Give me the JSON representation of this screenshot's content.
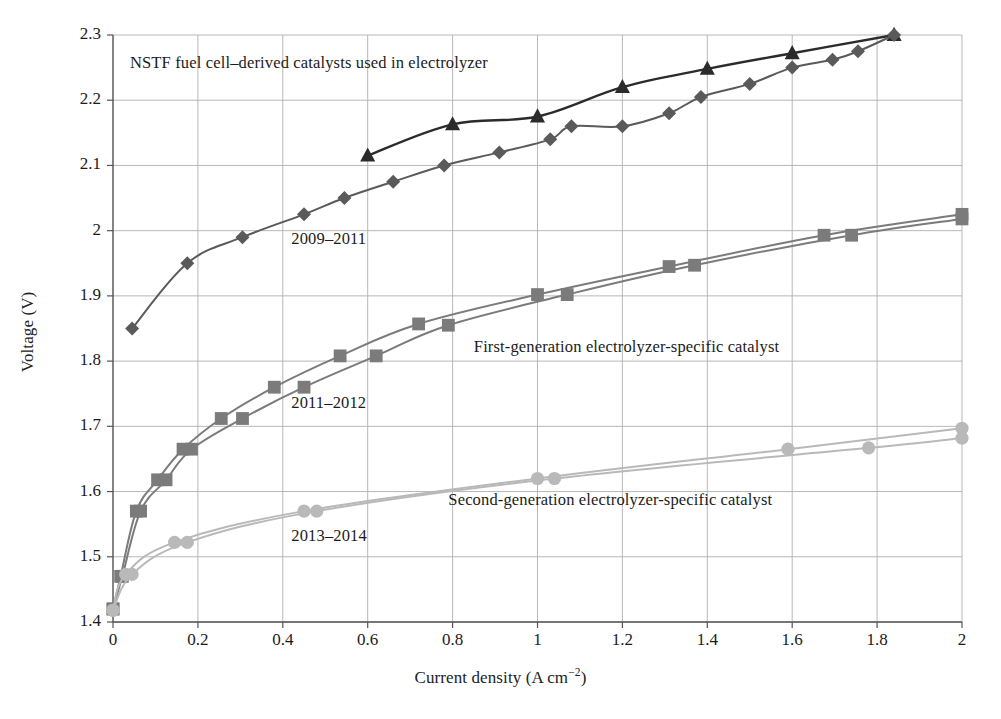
{
  "chart_data": {
    "type": "line",
    "title": "",
    "xlabel": "Current density (A cm⁻²)",
    "ylabel": "Voltage (V)",
    "xlim": [
      0,
      2
    ],
    "ylim": [
      1.4,
      2.3
    ],
    "xticks": [
      "0",
      "0.2",
      "0.4",
      "0.6",
      "0.8",
      "1",
      "1.2",
      "1.4",
      "1.6",
      "1.8",
      "2"
    ],
    "xtick_values": [
      0,
      0.2,
      0.4,
      0.6,
      0.8,
      1,
      1.2,
      1.4,
      1.6,
      1.8,
      2
    ],
    "yticks": [
      "1.4",
      "1.5",
      "1.6",
      "1.7",
      "1.8",
      "1.9",
      "2",
      "2.1",
      "2.2",
      "2.3"
    ],
    "ytick_values": [
      1.4,
      1.5,
      1.6,
      1.7,
      1.8,
      1.9,
      2.0,
      2.1,
      2.2,
      2.3
    ],
    "grid": true,
    "legend": "none",
    "annotations": [
      {
        "text": "NSTF fuel cell–derived catalysts used in electrolyzer",
        "x": 0.04,
        "y": 2.255
      },
      {
        "text": "2009–2011",
        "x": 0.42,
        "y": 1.985
      },
      {
        "text": "First-generation electrolyzer-specific catalyst",
        "x": 0.85,
        "y": 1.82
      },
      {
        "text": "2011–2012",
        "x": 0.42,
        "y": 1.735
      },
      {
        "text": "Second-generation electrolyzer-specific catalyst",
        "x": 0.79,
        "y": 1.585
      },
      {
        "text": "2013–2014",
        "x": 0.42,
        "y": 1.53
      }
    ],
    "series": [
      {
        "name": "2009–2011 triangle",
        "marker": "triangle",
        "color": "#2b2b2b",
        "x": [
          0.6,
          0.8,
          1.0,
          1.2,
          1.4,
          1.6,
          1.84
        ],
        "y": [
          2.115,
          2.163,
          2.175,
          2.22,
          2.248,
          2.272,
          2.3
        ]
      },
      {
        "name": "2009–2011 diamond",
        "marker": "diamond",
        "color": "#5a5a5a",
        "x": [
          0.045,
          0.175,
          0.305,
          0.45,
          0.545,
          0.66,
          0.78,
          0.91,
          1.03,
          1.08,
          1.2,
          1.31,
          1.385,
          1.5,
          1.6,
          1.695,
          1.755,
          1.84
        ],
        "y": [
          1.85,
          1.95,
          1.99,
          2.025,
          2.05,
          2.075,
          2.1,
          2.12,
          2.14,
          2.16,
          2.16,
          2.18,
          2.205,
          2.225,
          2.25,
          2.262,
          2.275,
          2.3
        ]
      },
      {
        "name": "2011–2012 square upper",
        "marker": "square",
        "color": "#7b7b7b",
        "x": [
          0.0,
          0.018,
          0.055,
          0.105,
          0.165,
          0.255,
          0.38,
          0.535,
          0.72,
          1.0,
          1.31,
          1.675,
          2.0
        ],
        "y": [
          1.42,
          1.47,
          1.57,
          1.618,
          1.665,
          1.712,
          1.76,
          1.808,
          1.857,
          1.902,
          1.945,
          1.993,
          2.025
        ]
      },
      {
        "name": "2011–2012 square lower",
        "marker": "square",
        "color": "#7b7b7b",
        "x": [
          0.0,
          0.022,
          0.065,
          0.125,
          0.185,
          0.305,
          0.45,
          0.62,
          0.79,
          1.07,
          1.37,
          1.74,
          2.0
        ],
        "y": [
          1.42,
          1.47,
          1.57,
          1.618,
          1.665,
          1.712,
          1.76,
          1.808,
          1.855,
          1.902,
          1.947,
          1.993,
          2.018
        ]
      },
      {
        "name": "2013–2014 circle upper",
        "marker": "circle",
        "color": "#b9b9b9",
        "x": [
          0.0,
          0.03,
          0.145,
          0.45,
          1.0,
          1.59,
          2.0
        ],
        "y": [
          1.418,
          1.473,
          1.522,
          1.57,
          1.62,
          1.665,
          1.697
        ]
      },
      {
        "name": "2013–2014 circle lower",
        "marker": "circle",
        "color": "#b9b9b9",
        "x": [
          0.0,
          0.045,
          0.175,
          0.48,
          1.04,
          1.78,
          2.0
        ],
        "y": [
          1.418,
          1.473,
          1.522,
          1.57,
          1.62,
          1.667,
          1.682
        ]
      }
    ]
  },
  "colors": {
    "grid": "#b0b0b0",
    "axis": "#555555",
    "text": "#1b1b1b",
    "series_dark": "#2b2b2b",
    "series_diamond": "#5a5a5a",
    "series_square": "#7b7b7b",
    "series_circle": "#b9b9b9",
    "background": "#ffffff"
  }
}
